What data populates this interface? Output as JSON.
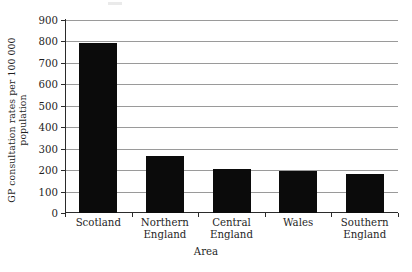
{
  "chart_data": {
    "type": "bar",
    "title": "",
    "xlabel": "Area",
    "ylabel": "GP consultation rates per 100 000 population",
    "ylabel_line1": "GP consultation rates per 100 000",
    "ylabel_line2": "population",
    "categories": [
      "Scotland",
      "Northern England",
      "Central England",
      "Wales",
      "Southern England"
    ],
    "category_lines": [
      [
        "Scotland"
      ],
      [
        "Northern",
        "England"
      ],
      [
        "Central",
        "England"
      ],
      [
        "Wales"
      ],
      [
        "Southern",
        "England"
      ]
    ],
    "values": [
      795,
      265,
      205,
      195,
      180
    ],
    "ylim": [
      0,
      900
    ],
    "ytick_labels": [
      "900",
      "800",
      "700",
      "600",
      "500",
      "400",
      "300",
      "200",
      "100",
      "0"
    ],
    "ytick_values": [
      900,
      800,
      700,
      600,
      500,
      400,
      300,
      200,
      100,
      0
    ],
    "grid": true,
    "legend": "none",
    "bar_color": "#0b0b0b",
    "gridline_color": "#9a9a9a",
    "axis_color": "#2b2b2b",
    "background_color": "#ffffff"
  }
}
